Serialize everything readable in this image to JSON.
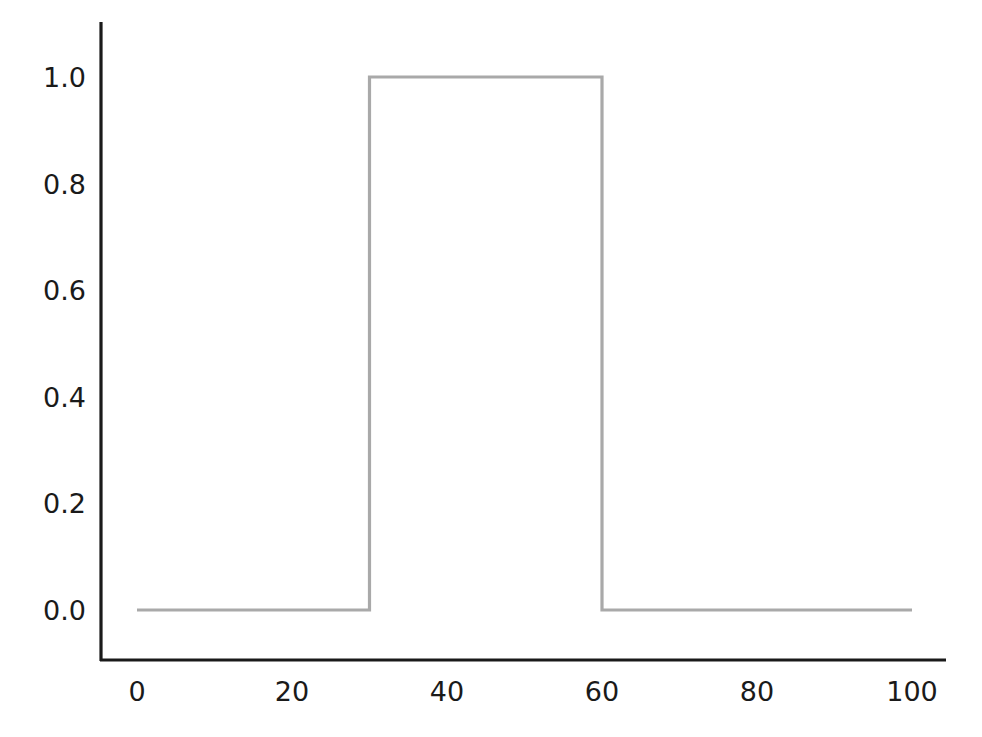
{
  "chart_data": {
    "type": "line",
    "title": "",
    "subtitle": "",
    "xlabel": "",
    "ylabel": "",
    "xlim": [
      0,
      100
    ],
    "ylim": [
      0.0,
      1.0
    ],
    "grid": false,
    "legend": null,
    "legend_position": "none",
    "x_ticks": [
      "0",
      "20",
      "40",
      "60",
      "80",
      "100"
    ],
    "x_tick_values": [
      0,
      20,
      40,
      60,
      80,
      100
    ],
    "y_ticks": [
      "0.0",
      "0.2",
      "0.4",
      "0.6",
      "0.8",
      "1.0"
    ],
    "y_tick_values": [
      0.0,
      0.2,
      0.4,
      0.6,
      0.8,
      1.0
    ],
    "series": [
      {
        "name": "pulse",
        "color": "#a9a9a9",
        "line_width": 3,
        "drawstyle": "steps",
        "x": [
          0,
          30,
          30,
          60,
          60,
          100
        ],
        "values": [
          0.0,
          0.0,
          1.0,
          1.0,
          0.0,
          0.0
        ]
      }
    ],
    "annotations": []
  },
  "axes": {
    "spine_color": "#1a1a1a",
    "spine_width": 3,
    "left_spine_visible": true,
    "bottom_spine_visible": true,
    "top_spine_visible": false,
    "right_spine_visible": false,
    "tick_marks_visible": false
  },
  "figure": {
    "background": "#ffffff"
  }
}
